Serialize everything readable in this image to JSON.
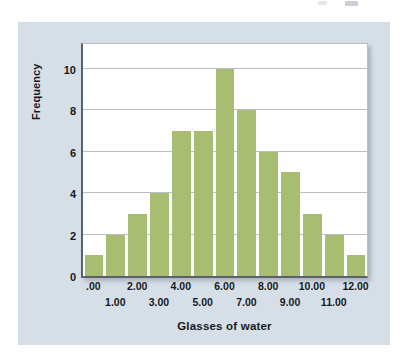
{
  "chart_data": {
    "type": "bar",
    "title": "",
    "subtitle": "",
    "xlabel": "Glasses of water",
    "ylabel": "Frequency",
    "categories": [
      ".00",
      "1.00",
      "2.00",
      "3.00",
      "4.00",
      "5.00",
      "6.00",
      "7.00",
      "8.00",
      "9.00",
      "10.00",
      "11.00",
      "12.00"
    ],
    "values": [
      1,
      2,
      3,
      4,
      7,
      7,
      10,
      8,
      6,
      5,
      3,
      2,
      1
    ],
    "x": [
      0,
      1,
      2,
      3,
      4,
      5,
      6,
      7,
      8,
      9,
      10,
      11,
      12
    ],
    "xlim": [
      -0.5,
      12.5
    ],
    "ylim": [
      0,
      11.2
    ],
    "y_ticks": [
      0,
      2,
      4,
      6,
      8,
      10
    ],
    "y_tick_labels": [
      "0",
      "2",
      "4",
      "6",
      "8",
      "10"
    ],
    "x_tick_labels_top": [
      ".00",
      "2.00",
      "4.00",
      "6.00",
      "8.00",
      "10.00",
      "12.00"
    ],
    "x_tick_labels_bottom": [
      "1.00",
      "3.00",
      "5.00",
      "7.00",
      "9.00",
      "11.00"
    ],
    "grid": true,
    "grid_axis": "y",
    "legend": false,
    "legend_position": "none",
    "bar_color": "#a8bd72",
    "plot_background": "#ffffff",
    "panel_background": "#d6dfe8",
    "axis_color": "#5c6166",
    "gridline_color": "#b9bfc6",
    "text_color": "#16191c"
  }
}
